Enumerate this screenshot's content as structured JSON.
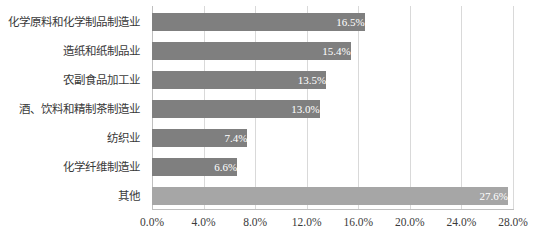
{
  "chart_data": {
    "type": "bar",
    "orientation": "horizontal",
    "title": "",
    "subtitle": "",
    "xlabel": "",
    "ylabel": "",
    "xlim": [
      0,
      28
    ],
    "xtick_step": 4,
    "grid": true,
    "legend": "none",
    "categories": [
      "化学原料和化学制品制造业",
      "造纸和纸制品业",
      "农副食品加工业",
      "酒、饮料和精制茶制造业",
      "纺织业",
      "化学纤维制造业",
      "其他"
    ],
    "values": [
      16.5,
      15.4,
      13.5,
      13.0,
      7.4,
      6.6,
      27.6
    ],
    "value_labels": [
      "16.5%",
      "15.4%",
      "13.5%",
      "13.0%",
      "7.4%",
      "6.6%",
      "27.6%"
    ],
    "tick_labels": [
      "0.0%",
      "4.0%",
      "8.0%",
      "12.0%",
      "16.0%",
      "20.0%",
      "24.0%",
      "28.0%"
    ],
    "tick_values": [
      0,
      4,
      8,
      12,
      16,
      20,
      24,
      28
    ],
    "bar_colors": [
      "#7f7f7f",
      "#7f7f7f",
      "#7f7f7f",
      "#7f7f7f",
      "#7f7f7f",
      "#7f7f7f",
      "#a6a6a6"
    ],
    "value_label_color": "#ffffff",
    "gridline_color": "#d9d9d9",
    "axis_color": "#bfbfbf",
    "text_color": "#3a3a3a",
    "background": "#ffffff"
  }
}
